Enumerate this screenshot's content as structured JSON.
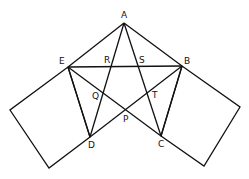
{
  "diagram": {
    "stroke_color": "#111111",
    "background": "#ffffff",
    "points": {
      "A": [
        124,
        23
      ],
      "B": [
        182,
        66
      ],
      "C": [
        161,
        136
      ],
      "D": [
        90,
        137
      ],
      "E": [
        68,
        67
      ],
      "P": [
        125,
        110
      ],
      "Q": [
        104,
        97
      ],
      "R": [
        111,
        66
      ],
      "S": [
        138,
        66
      ],
      "T": [
        146,
        96
      ]
    },
    "labels": [
      {
        "text": "A",
        "x": 121,
        "y": 11
      },
      {
        "text": "E",
        "x": 59,
        "y": 57
      },
      {
        "text": "R",
        "x": 104,
        "y": 56
      },
      {
        "text": "S",
        "x": 139,
        "y": 56
      },
      {
        "text": "B",
        "x": 184,
        "y": 57
      },
      {
        "text": "Q",
        "x": 92,
        "y": 92
      },
      {
        "text": "T",
        "x": 152,
        "y": 91
      },
      {
        "text": "P",
        "x": 123,
        "y": 115
      },
      {
        "text": "D",
        "x": 88,
        "y": 141
      },
      {
        "text": "C",
        "x": 158,
        "y": 140
      }
    ],
    "segments": [
      "AE",
      "AB",
      "EB",
      "AD",
      "AC",
      "EC",
      "BD",
      "ED",
      "BC"
    ],
    "squares": [
      {
        "name": "left-square",
        "corners": [
          [
            68,
            67
          ],
          [
            90,
            137
          ],
          [
            49,
            168
          ],
          [
            10,
            110
          ]
        ]
      },
      {
        "name": "right-square",
        "corners": [
          [
            182,
            66
          ],
          [
            161,
            136
          ],
          [
            204,
            166
          ],
          [
            240,
            107
          ]
        ]
      }
    ]
  }
}
